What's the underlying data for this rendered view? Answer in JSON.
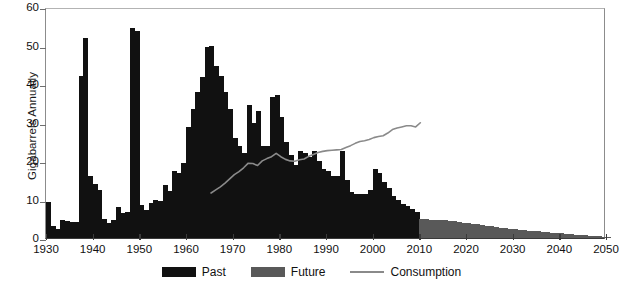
{
  "chart": {
    "ylabel": "Gigabarrels Annually",
    "xlabel": "",
    "title": ""
  },
  "axes": {
    "y_ticks": [
      "0",
      "10",
      "20",
      "30",
      "40",
      "50",
      "60"
    ],
    "x_ticks": [
      "1930",
      "1940",
      "1950",
      "1960",
      "1970",
      "1980",
      "1990",
      "2000",
      "2010",
      "2020",
      "2030",
      "2040",
      "2050"
    ]
  },
  "legend": {
    "items": [
      {
        "label": "Past",
        "swatch": "#111111",
        "type": "swatch"
      },
      {
        "label": "Future",
        "swatch": "#595959",
        "type": "swatch"
      },
      {
        "label": "Consumption",
        "swatch": "#8a8a8a",
        "type": "line"
      }
    ]
  },
  "colors": {
    "past": "#111111",
    "future": "#595959",
    "consumption": "#8a8a8a",
    "axis": "#3a3a3a",
    "background": "#ffffff"
  },
  "chart_data": {
    "type": "bar",
    "title": "",
    "xlabel": "",
    "ylabel": "Gigabarrels Annually",
    "xlim": [
      1930,
      2050
    ],
    "ylim": [
      0,
      60
    ],
    "grid": false,
    "legend_position": "bottom",
    "series": [
      {
        "name": "Past",
        "color": "#111111",
        "x": [
          1930,
          1931,
          1932,
          1933,
          1934,
          1935,
          1936,
          1937,
          1938,
          1939,
          1940,
          1941,
          1942,
          1943,
          1944,
          1945,
          1946,
          1947,
          1948,
          1949,
          1950,
          1951,
          1952,
          1953,
          1954,
          1955,
          1956,
          1957,
          1958,
          1959,
          1960,
          1961,
          1962,
          1963,
          1964,
          1965,
          1966,
          1967,
          1968,
          1969,
          1970,
          1971,
          1972,
          1973,
          1974,
          1975,
          1976,
          1977,
          1978,
          1979,
          1980,
          1981,
          1982,
          1983,
          1984,
          1985,
          1986,
          1987,
          1988,
          1989,
          1990,
          1991,
          1992,
          1993,
          1994,
          1995,
          1996,
          1997,
          1998,
          1999,
          2000,
          2001,
          2002,
          2003,
          2004,
          2005,
          2006,
          2007,
          2008,
          2009
        ],
        "values": [
          9.3,
          3.2,
          2.3,
          4.8,
          4.3,
          4.2,
          4.2,
          42.0,
          52.0,
          16.0,
          14.0,
          12.5,
          5.0,
          4.0,
          4.8,
          8.0,
          6.5,
          6.8,
          54.5,
          53.8,
          8.5,
          7.2,
          9.0,
          10.0,
          9.5,
          13.8,
          12.3,
          17.5,
          17.0,
          19.5,
          28.8,
          33.5,
          38.0,
          41.8,
          49.5,
          50.0,
          44.8,
          42.0,
          38.0,
          33.5,
          26.0,
          24.0,
          22.0,
          34.5,
          30.0,
          33.0,
          24.0,
          24.0,
          36.5,
          37.2,
          31.5,
          25.0,
          21.5,
          19.0,
          22.5,
          22.2,
          21.0,
          22.5,
          20.0,
          18.0,
          17.5,
          16.0,
          16.0,
          22.5,
          15.0,
          12.0,
          11.5,
          11.5,
          11.5,
          12.5,
          17.8,
          17.0,
          14.5,
          13.0,
          11.0,
          9.8,
          8.8,
          8.2,
          7.5,
          6.8
        ]
      },
      {
        "name": "Future",
        "color": "#595959",
        "x": [
          2010,
          2011,
          2012,
          2013,
          2014,
          2015,
          2016,
          2017,
          2018,
          2019,
          2020,
          2021,
          2022,
          2023,
          2024,
          2025,
          2026,
          2027,
          2028,
          2029,
          2030,
          2031,
          2032,
          2033,
          2034,
          2035,
          2036,
          2037,
          2038,
          2039,
          2040,
          2041,
          2042,
          2043,
          2044,
          2045,
          2046,
          2047,
          2048,
          2049,
          2050
        ],
        "values": [
          5.0,
          4.9,
          4.8,
          4.7,
          4.8,
          4.6,
          4.4,
          4.3,
          4.2,
          4.0,
          3.9,
          3.7,
          3.6,
          3.4,
          3.2,
          3.0,
          2.9,
          2.7,
          2.6,
          2.4,
          2.3,
          2.2,
          2.0,
          1.9,
          1.8,
          1.7,
          1.6,
          1.5,
          1.4,
          1.3,
          1.2,
          1.1,
          1.0,
          0.9,
          0.8,
          0.7,
          0.6,
          0.5,
          0.4,
          0.3,
          0.2
        ]
      },
      {
        "name": "Consumption",
        "type": "line",
        "color": "#8a8a8a",
        "x": [
          1965,
          1966,
          1967,
          1968,
          1969,
          1970,
          1971,
          1972,
          1973,
          1974,
          1975,
          1976,
          1977,
          1978,
          1979,
          1980,
          1981,
          1982,
          1983,
          1984,
          1985,
          1986,
          1987,
          1988,
          1989,
          1990,
          1991,
          1992,
          1993,
          1994,
          1995,
          1996,
          1997,
          1998,
          1999,
          2000,
          2001,
          2002,
          2003,
          2004,
          2005,
          2006,
          2007,
          2008,
          2009,
          2010
        ],
        "values": [
          11.8,
          12.6,
          13.4,
          14.4,
          15.5,
          16.6,
          17.4,
          18.4,
          19.6,
          19.5,
          19.0,
          20.2,
          20.8,
          21.3,
          22.2,
          21.3,
          20.6,
          20.2,
          20.1,
          20.5,
          20.7,
          21.4,
          21.9,
          22.4,
          22.7,
          22.9,
          23.0,
          23.1,
          23.2,
          23.7,
          24.2,
          24.8,
          25.3,
          25.5,
          25.8,
          26.3,
          26.6,
          26.8,
          27.5,
          28.4,
          28.8,
          29.1,
          29.4,
          29.4,
          29.1,
          30.2
        ]
      }
    ]
  }
}
